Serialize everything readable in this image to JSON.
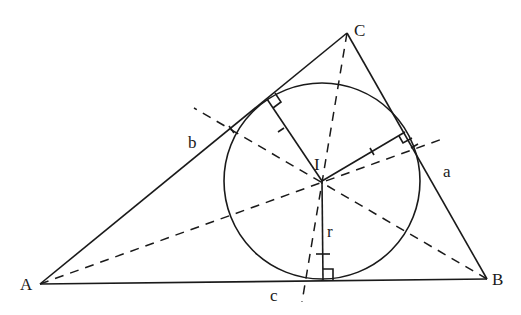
{
  "diagram": {
    "vertices": {
      "A": {
        "label": "A",
        "x": 40,
        "y": 284
      },
      "B": {
        "label": "B",
        "x": 487,
        "y": 279
      },
      "C": {
        "label": "C",
        "x": 347,
        "y": 33
      }
    },
    "incenter": {
      "label": "I",
      "x": 322,
      "y": 181
    },
    "inradius_label": "r",
    "side_labels": {
      "a": "a",
      "b": "b",
      "c": "c"
    },
    "circle": {
      "cx": 322,
      "cy": 181,
      "r": 98
    },
    "colors": {
      "stroke": "#1a1a1a",
      "background": "#ffffff"
    }
  }
}
